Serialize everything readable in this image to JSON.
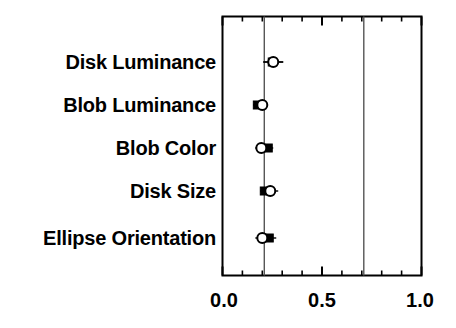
{
  "chart_data": {
    "type": "scatter",
    "title": "",
    "xlabel": "",
    "ylabel": "",
    "xlim": [
      0.0,
      1.0
    ],
    "xticks": [
      0.0,
      0.5,
      1.0
    ],
    "xtick_labels": [
      "0.0",
      "0.5",
      "1.0"
    ],
    "minor_xticks": [
      0.1,
      0.2,
      0.3,
      0.4,
      0.6,
      0.7,
      0.8,
      0.9
    ],
    "grid": false,
    "legend": "none",
    "categories": [
      "Disk Luminance",
      "Blob Luminance",
      "Blob Color",
      "Disk Size",
      "Ellipse Orientation"
    ],
    "reference_lines": [
      0.21,
      0.71
    ],
    "series": [
      {
        "name": "filled",
        "marker": "filled",
        "values": [
          0.25,
          0.175,
          0.23,
          0.21,
          0.235
        ],
        "err_low": [
          0.205,
          0.155,
          0.205,
          0.19,
          0.205
        ],
        "err_high": [
          0.305,
          0.205,
          0.255,
          0.235,
          0.27
        ]
      },
      {
        "name": "open",
        "marker": "open",
        "values": [
          0.255,
          0.2,
          0.195,
          0.24,
          0.2
        ],
        "err_low": [
          0.205,
          0.155,
          0.165,
          0.19,
          0.165
        ],
        "err_high": [
          0.305,
          0.225,
          0.225,
          0.28,
          0.235
        ]
      }
    ]
  },
  "axis": {
    "tick_0": "0.0",
    "tick_1": "0.5",
    "tick_2": "1.0"
  },
  "labels": {
    "row_0": "Disk Luminance",
    "row_1": "Blob Luminance",
    "row_2": "Blob Color",
    "row_3": "Disk Size",
    "row_4": "Ellipse Orientation"
  },
  "colors": {
    "axis": "#000000",
    "marker_fill": "#000000",
    "marker_open": "#ffffff",
    "reference_line": "#555555",
    "background": "#ffffff"
  }
}
